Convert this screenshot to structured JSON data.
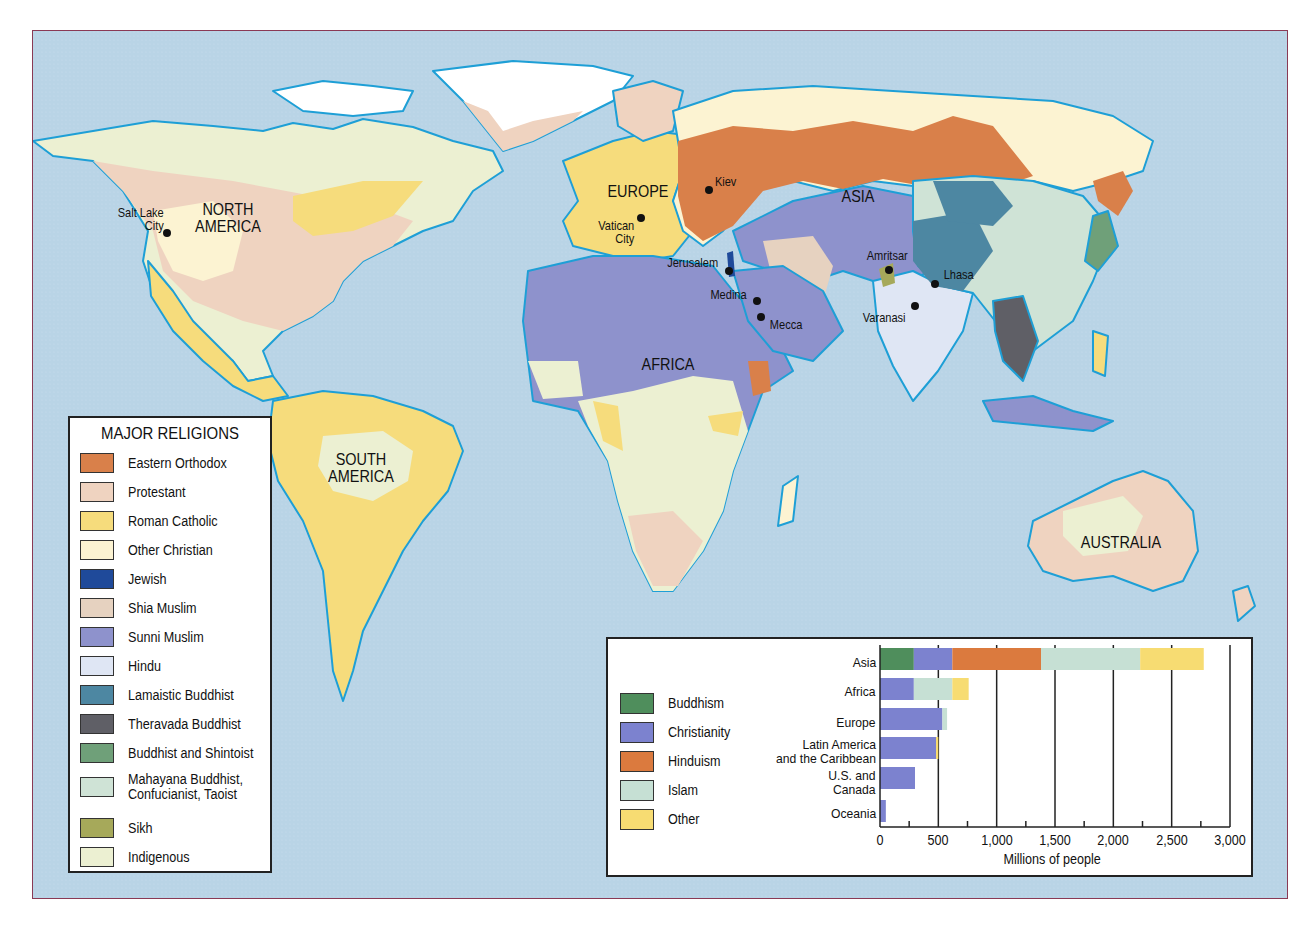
{
  "map": {
    "continent_labels": [
      {
        "id": "north-america",
        "text": "NORTH\nAMERICA"
      },
      {
        "id": "south-america",
        "text": "SOUTH\nAMERICA"
      },
      {
        "id": "europe",
        "text": "EUROPE"
      },
      {
        "id": "asia",
        "text": "ASIA"
      },
      {
        "id": "africa",
        "text": "AFRICA"
      },
      {
        "id": "australia",
        "text": "AUSTRALIA"
      }
    ],
    "continents": {
      "north_america_1": "NORTH",
      "north_america_2": "AMERICA",
      "south_america_1": "SOUTH",
      "south_america_2": "AMERICA",
      "europe": "EUROPE",
      "asia": "ASIA",
      "africa": "AFRICA",
      "australia": "AUSTRALIA"
    },
    "cities": {
      "salt_lake_city_1": "Salt Lake",
      "salt_lake_city_2": "City",
      "kiev": "Kiev",
      "vatican_city_1": "Vatican",
      "vatican_city_2": "City",
      "jerusalem": "Jerusalem",
      "medina": "Medina",
      "mecca": "Mecca",
      "amritsar": "Amritsar",
      "lhasa": "Lhasa",
      "varanasi": "Varanasi"
    },
    "colors": {
      "ocean": "#b9d4e6",
      "coastline": "#1e9fd6",
      "frame_border": "#8a3a55"
    }
  },
  "legend": {
    "title": "MAJOR RELIGIONS",
    "items": [
      {
        "label": "Eastern Orthodox",
        "color": "#d9804a"
      },
      {
        "label": "Protestant",
        "color": "#efd3c0"
      },
      {
        "label": "Roman Catholic",
        "color": "#f6dc7c"
      },
      {
        "label": "Other Christian",
        "color": "#fcf3d2"
      },
      {
        "label": "Jewish",
        "color": "#1f4a9a"
      },
      {
        "label": "Shia Muslim",
        "color": "#e6d2c0"
      },
      {
        "label": "Sunni Muslim",
        "color": "#8e92cc"
      },
      {
        "label": "Hindu",
        "color": "#dfe6f4"
      },
      {
        "label": "Lamaistic Buddhist",
        "color": "#4d87a2"
      },
      {
        "label": "Theravada Buddhist",
        "color": "#5f5f66"
      },
      {
        "label": "Buddhist and Shintoist",
        "color": "#6fa079"
      },
      {
        "label": "Mahayana Buddhist, Confucianist, Taoist",
        "label_line1": "Mahayana Buddhist,",
        "label_line2": "Confucianist, Taoist",
        "color": "#cfe3d6"
      },
      {
        "label": "Sikh",
        "color": "#a6a95a"
      },
      {
        "label": "Indigenous",
        "color": "#ecf0d2"
      }
    ]
  },
  "chart_data": {
    "type": "bar",
    "orientation": "horizontal",
    "stacked": true,
    "title": "",
    "xlabel": "Millions of people",
    "ylabel": "",
    "xlim": [
      0,
      3000
    ],
    "x_ticks": [
      "0",
      "500",
      "1,000",
      "1,500",
      "2,000",
      "2,500",
      "3,000"
    ],
    "grid": "vertical major gridlines every 500",
    "legend_position": "left",
    "categories": [
      "Asia",
      "Africa",
      "Europe",
      "Latin America and the Caribbean",
      "U.S. and Canada",
      "Oceania"
    ],
    "category_lines": [
      [
        "Asia"
      ],
      [
        "Africa"
      ],
      [
        "Europe"
      ],
      [
        "Latin America",
        "and the Caribbean"
      ],
      [
        "U.S. and",
        "Canada"
      ],
      [
        "Oceania"
      ]
    ],
    "series": [
      {
        "name": "Buddhism",
        "color": "#4f8e5c",
        "values": [
          290,
          0,
          0,
          0,
          0,
          0
        ]
      },
      {
        "name": "Christianity",
        "color": "#7c82cf",
        "values": [
          330,
          290,
          535,
          480,
          300,
          50
        ]
      },
      {
        "name": "Hinduism",
        "color": "#db7a3e",
        "values": [
          760,
          0,
          0,
          0,
          0,
          0
        ]
      },
      {
        "name": "Islam",
        "color": "#c6e0d4",
        "values": [
          850,
          330,
          40,
          0,
          0,
          0
        ]
      },
      {
        "name": "Other",
        "color": "#f7dc72",
        "values": [
          545,
          140,
          0,
          20,
          0,
          0
        ]
      }
    ]
  },
  "chart_panel": {
    "legend": [
      {
        "label": "Buddhism"
      },
      {
        "label": "Christianity"
      },
      {
        "label": "Hinduism"
      },
      {
        "label": "Islam"
      },
      {
        "label": "Other"
      }
    ],
    "categories": {
      "asia": "Asia",
      "africa": "Africa",
      "europe": "Europe",
      "latam_1": "Latin America",
      "latam_2": "and the Caribbean",
      "usca_1": "U.S. and",
      "usca_2": "Canada",
      "oceania": "Oceania"
    },
    "ticks": [
      "0",
      "500",
      "1,000",
      "1,500",
      "2,000",
      "2,500",
      "3,000"
    ],
    "x_axis_title": "Millions of people"
  }
}
